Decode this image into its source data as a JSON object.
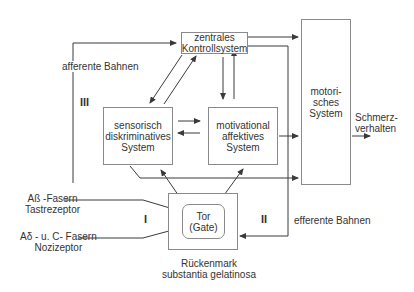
{
  "boxes": {
    "zentral": "zentrales\nKontrollsystem",
    "sensorisch": "sensorisch\ndiskriminatives\nSystem",
    "motivational": "motivational\naffektives\nSystem",
    "motorisch": "motori-\nsches\nSystem",
    "tor": "Tor\n(Gate)"
  },
  "labels": {
    "afferente": "afferente Bahnen",
    "efferente": "efferente Bahnen",
    "schmerz": "Schmerz-\nverhalten",
    "abeta": "Aß -Fasern\nTastrezeptor",
    "adelta": "Aδ -  u. C- Fasern\nNozizeptor",
    "rueckenmark": "Rückenmark\nsubstantia gelatinosa"
  },
  "roman": {
    "one": "I",
    "two": "II",
    "three": "III"
  },
  "colors": {
    "line": "#3a3a3a",
    "box_border": "#8a8a8a"
  }
}
